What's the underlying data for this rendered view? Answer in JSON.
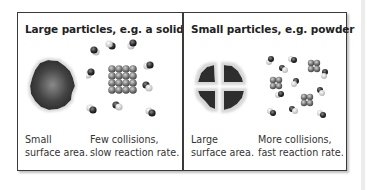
{
  "panels": [
    {
      "title": "Large particles, e.g. a solid",
      "captions": [
        {
          "text": "Small\nsurface area."
        },
        {
          "text": "Few collisions,\nslow reaction rate."
        }
      ],
      "illustration": "single-large-particle-and-lattice"
    },
    {
      "title": "Small particles, e.g. powder",
      "captions": [
        {
          "text": "Large\nsurface area."
        },
        {
          "text": "More collisions,\nfast reaction rate."
        }
      ],
      "illustration": "split-particle-and-clusters"
    }
  ],
  "colors": {
    "border": "#3a3a3a",
    "particle_dark": "#2e2e2e",
    "particle_light": "#bdbdbd",
    "text": "#333333"
  }
}
